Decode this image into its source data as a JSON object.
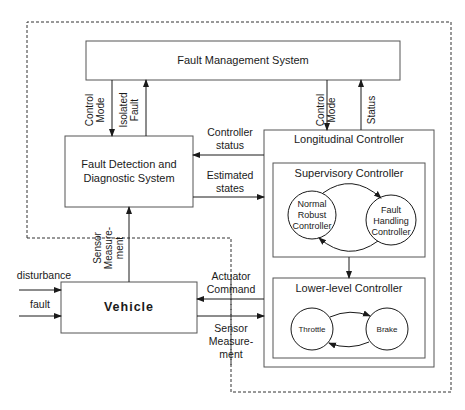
{
  "diagram": {
    "boxes": {
      "fault_management": "Fault Management System",
      "fdd_line1": "Fault Detection and",
      "fdd_line2": "Diagnostic System",
      "longitudinal": "Longitudinal Controller",
      "supervisory": "Supervisory Controller",
      "lower_level": "Lower-level Controller",
      "vehicle": "Vehicle"
    },
    "states": {
      "normal_1": "Normal",
      "normal_2": "Robust",
      "normal_3": "Controller",
      "fault_1": "Fault",
      "fault_2": "Handling",
      "fault_3": "Controller",
      "throttle": "Throttle",
      "brake": "Brake"
    },
    "signals": {
      "control_mode_left_1": "Control",
      "control_mode_left_2": "Mode",
      "isolated_fault_1": "Isolated",
      "isolated_fault_2": "Fault",
      "control_mode_right_1": "Control",
      "control_mode_right_2": "Mode",
      "status": "Status",
      "controller_status_1": "Controller",
      "controller_status_2": "status",
      "estimated_states_1": "Estimated",
      "estimated_states_2": "states",
      "sensor_meas_vert_1": "Sensor",
      "sensor_meas_vert_2": "Measure-",
      "sensor_meas_vert_3": "ment",
      "actuator_command_1": "Actuator",
      "actuator_command_2": "Command",
      "sensor_meas_1": "Sensor",
      "sensor_meas_2": "Measure-",
      "sensor_meas_3": "ment",
      "disturbance": "disturbance",
      "fault": "fault"
    }
  }
}
